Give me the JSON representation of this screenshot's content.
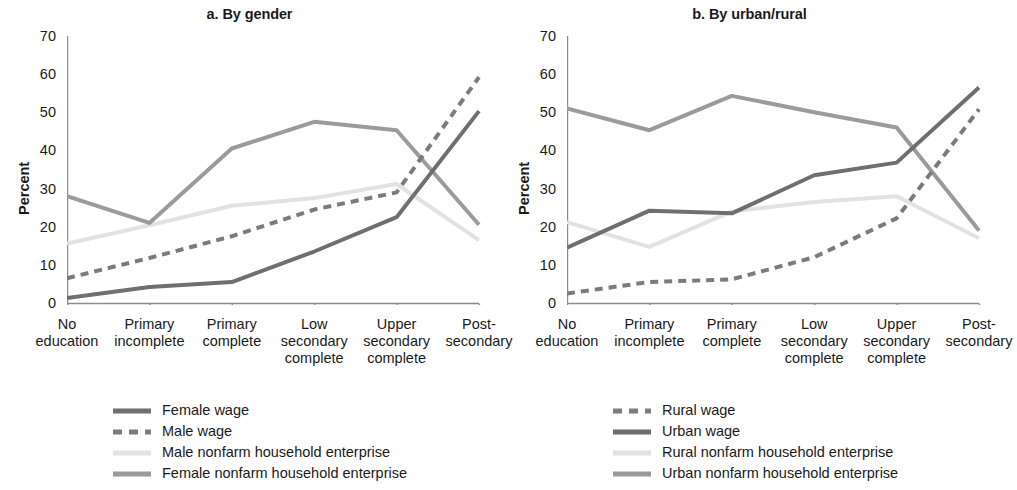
{
  "figure": {
    "ylabel": "Percent",
    "y_ticks": [
      0,
      10,
      20,
      30,
      40,
      50,
      60,
      70
    ],
    "categories": [
      "No\neducation",
      "Primary\nincomplete",
      "Primary\ncomplete",
      "Low\nsecondary\ncomplete",
      "Upper\nsecondary\ncomplete",
      "Post-\nsecondary"
    ]
  },
  "colors": {
    "dark_gray": "#6f6f6f",
    "mid_gray": "#969696",
    "light_gray": "#c8c8c8",
    "very_light_gray": "#e2e2e2",
    "axis": "#8c8c8c",
    "text": "#1a1a1a"
  },
  "chart_data": [
    {
      "type": "line",
      "title": "a. By gender",
      "xlabel": "",
      "ylabel": "Percent",
      "ylim": [
        0,
        70
      ],
      "grid": false,
      "legend_position": "below",
      "categories": [
        "No education",
        "Primary incomplete",
        "Primary complete",
        "Low secondary complete",
        "Upper secondary complete",
        "Post-secondary"
      ],
      "series": [
        {
          "name": "Female wage",
          "style": "solid",
          "color": "#6f6f6f",
          "width": 4,
          "values": [
            1.3,
            4.2,
            5.5,
            13.5,
            22.5,
            50.3
          ]
        },
        {
          "name": "Male wage",
          "style": "dashed",
          "color": "#7b7b7b",
          "width": 4,
          "values": [
            6.5,
            11.8,
            17.5,
            24.5,
            29.0,
            59.2
          ]
        },
        {
          "name": "Male nonfarm household enterprise",
          "style": "solid",
          "color": "#e2e2e2",
          "width": 4,
          "values": [
            15.6,
            20.4,
            25.5,
            27.5,
            31.2,
            16.5
          ]
        },
        {
          "name": "Female nonfarm household enterprise",
          "style": "solid",
          "color": "#9b9b9b",
          "width": 4,
          "values": [
            28.0,
            21.0,
            40.5,
            47.5,
            45.3,
            20.5
          ]
        }
      ]
    },
    {
      "type": "line",
      "title": "b. By urban/rural",
      "xlabel": "",
      "ylabel": "Percent",
      "ylim": [
        0,
        70
      ],
      "grid": false,
      "legend_position": "below",
      "categories": [
        "No education",
        "Primary incomplete",
        "Primary complete",
        "Low secondary complete",
        "Upper secondary complete",
        "Post-secondary"
      ],
      "series": [
        {
          "name": "Rural wage",
          "style": "dashed",
          "color": "#7b7b7b",
          "width": 4,
          "values": [
            2.5,
            5.5,
            6.2,
            12.0,
            22.2,
            50.8
          ]
        },
        {
          "name": "Urban wage",
          "style": "solid",
          "color": "#6f6f6f",
          "width": 4,
          "values": [
            14.5,
            24.2,
            23.5,
            33.5,
            36.8,
            56.5
          ]
        },
        {
          "name": "Rural nonfarm household enterprise",
          "style": "solid",
          "color": "#e2e2e2",
          "width": 4,
          "values": [
            21.2,
            14.7,
            24.0,
            26.5,
            28.0,
            17.0
          ]
        },
        {
          "name": "Urban nonfarm household enterprise",
          "style": "solid",
          "color": "#9b9b9b",
          "width": 4,
          "values": [
            51.0,
            45.3,
            54.3,
            50.0,
            46.0,
            19.0
          ]
        }
      ]
    }
  ],
  "panels": [
    {
      "id": "by-gender",
      "title": "a. By gender",
      "legend": [
        {
          "label": "Female wage",
          "swatch": "solid-dark"
        },
        {
          "label": "Male wage",
          "swatch": "dashed-dark"
        },
        {
          "label": "Male nonfarm household enterprise",
          "swatch": "solid-verylight"
        },
        {
          "label": "Female nonfarm household enterprise",
          "swatch": "solid-mid"
        }
      ]
    },
    {
      "id": "by-urban-rural",
      "title": "b. By urban/rural",
      "legend": [
        {
          "label": "Rural wage",
          "swatch": "dashed-dark"
        },
        {
          "label": "Urban wage",
          "swatch": "solid-dark"
        },
        {
          "label": "Rural nonfarm household enterprise",
          "swatch": "solid-verylight"
        },
        {
          "label": "Urban nonfarm household enterprise",
          "swatch": "solid-mid"
        }
      ]
    }
  ]
}
